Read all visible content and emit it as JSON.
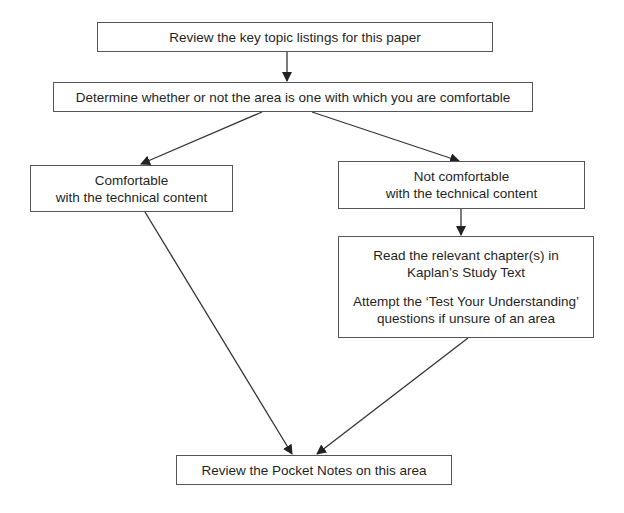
{
  "diagram": {
    "type": "flowchart",
    "nodes": [
      {
        "id": "review-topics",
        "lines": [
          "Review the key topic listings for this paper"
        ]
      },
      {
        "id": "determine",
        "lines": [
          "Determine whether or not the area is one with which you are comfortable"
        ]
      },
      {
        "id": "comfortable",
        "lines": [
          "Comfortable",
          "with the technical content"
        ]
      },
      {
        "id": "not-comfortable",
        "lines": [
          "Not comfortable",
          "with the technical content"
        ]
      },
      {
        "id": "read-chapters",
        "lines": [
          "Read the relevant chapter(s) in",
          "Kaplan’s Study Text",
          "",
          "Attempt the ‘Test Your Understanding’",
          "questions if unsure of an area"
        ]
      },
      {
        "id": "pocket-notes",
        "lines": [
          "Review the Pocket Notes on this area"
        ]
      }
    ],
    "edges": [
      {
        "from": "review-topics",
        "to": "determine"
      },
      {
        "from": "determine",
        "to": "comfortable"
      },
      {
        "from": "determine",
        "to": "not-comfortable"
      },
      {
        "from": "not-comfortable",
        "to": "read-chapters"
      },
      {
        "from": "comfortable",
        "to": "pocket-notes"
      },
      {
        "from": "read-chapters",
        "to": "pocket-notes"
      }
    ],
    "colors": {
      "background": "#ffffff",
      "border": "#555555",
      "arrow": "#333333",
      "text": "#1f1f1f"
    }
  }
}
